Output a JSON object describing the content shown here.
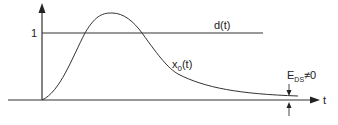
{
  "diagram": {
    "y_tick_label": "1",
    "x_axis_label": "t",
    "reference_label": "d(t)",
    "response_label_main": "x",
    "response_label_sub": "0",
    "response_label_suffix": "(t)",
    "error_label_main": "E",
    "error_label_sub": "DS",
    "error_label_suffix": "≠0",
    "colors": {
      "line": "#333333",
      "background": "#ffffff"
    }
  }
}
